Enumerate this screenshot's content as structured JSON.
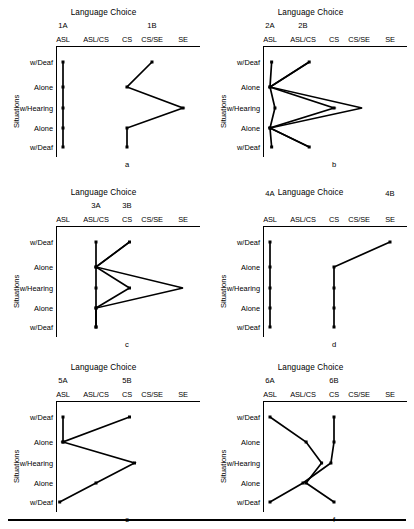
{
  "figure": {
    "y_axis_title": "Situations",
    "x_categories": [
      "ASL",
      "ASL/CS",
      "CS",
      "CS/SE",
      "SE"
    ],
    "y_categories": [
      "w/Deaf",
      "Alone",
      "w/Hearing",
      "Alone",
      "w/Deaf"
    ],
    "chart_title": "Language Choice",
    "bottom_rule": true
  },
  "chart_data": [
    {
      "type": "line",
      "panel": "a",
      "title": "Language Choice",
      "xlabel": "",
      "ylabel": "Situations",
      "categories": [
        "ASL",
        "ASL/CS",
        "CS",
        "CS/SE",
        "SE"
      ],
      "y_categories": [
        "w/Deaf",
        "Alone",
        "w/Hearing",
        "Alone",
        "w/Deaf"
      ],
      "xlim": [
        0,
        4
      ],
      "grid": false,
      "legend": "top-labels",
      "series": [
        {
          "name": "1A",
          "label_x": 0.0,
          "values": [
            0.0,
            0.0,
            0.0,
            0.0,
            0.0
          ]
        },
        {
          "name": "1B",
          "label_x": 3.0,
          "values": [
            3.0,
            2.0,
            4.0,
            2.0,
            2.0
          ]
        }
      ]
    },
    {
      "type": "line",
      "panel": "b",
      "title": "Language Choice",
      "xlabel": "",
      "ylabel": "Situations",
      "categories": [
        "ASL",
        "ASL/CS",
        "CS",
        "CS/SE",
        "SE"
      ],
      "y_categories": [
        "w/Deaf",
        "Alone",
        "w/Hearing",
        "Alone",
        "w/Deaf"
      ],
      "xlim": [
        0,
        4
      ],
      "grid": false,
      "legend": "top-labels",
      "series": [
        {
          "name": "2A",
          "label_x": 0.0,
          "values": [
            0.05,
            0.0,
            0.15,
            0.0,
            0.05
          ]
        },
        {
          "name": "2B",
          "label_x": 1.0,
          "values": [
            1.2,
            0.0,
            2.0,
            0.0,
            1.2
          ]
        },
        {
          "name": "2B-outer",
          "label_x": 1.0,
          "values": [
            1.2,
            0.0,
            3.1,
            0.0,
            1.2
          ]
        }
      ]
    },
    {
      "type": "line",
      "panel": "c",
      "title": "Language Choice",
      "xlabel": "",
      "ylabel": "Situations",
      "categories": [
        "ASL",
        "ASL/CS",
        "CS",
        "CS/SE",
        "SE"
      ],
      "y_categories": [
        "w/Deaf",
        "Alone",
        "w/Hearing",
        "Alone",
        "w/Deaf"
      ],
      "xlim": [
        0,
        4
      ],
      "grid": false,
      "legend": "top-labels",
      "series": [
        {
          "name": "3A",
          "label_x": 1.0,
          "values": [
            1.0,
            1.0,
            1.0,
            1.0,
            1.0
          ]
        },
        {
          "name": "3B",
          "label_x": 2.0,
          "values": [
            2.1,
            1.0,
            2.1,
            1.0,
            1.0
          ]
        },
        {
          "name": "3B-outer",
          "label_x": 2.0,
          "values": [
            2.1,
            1.0,
            4.0,
            1.0,
            1.0
          ]
        }
      ]
    },
    {
      "type": "line",
      "panel": "d",
      "title": "Language Choice",
      "xlabel": "",
      "ylabel": "Situations",
      "categories": [
        "ASL",
        "ASL/CS",
        "CS",
        "CS/SE",
        "SE"
      ],
      "y_categories": [
        "w/Deaf",
        "Alone",
        "w/Hearing",
        "Alone",
        "w/Deaf"
      ],
      "xlim": [
        0,
        4
      ],
      "grid": false,
      "legend": "top-labels",
      "series": [
        {
          "name": "4A",
          "label_x": 0.0,
          "values": [
            0.0,
            0.0,
            0.0,
            0.0,
            0.0
          ]
        },
        {
          "name": "4B",
          "label_x": 4.0,
          "values": [
            4.0,
            2.0,
            2.0,
            2.0,
            2.0
          ]
        }
      ]
    },
    {
      "type": "line",
      "panel": "e",
      "title": "Language Choice",
      "xlabel": "",
      "ylabel": "Situations",
      "categories": [
        "ASL",
        "ASL/CS",
        "CS",
        "CS/SE",
        "SE"
      ],
      "y_categories": [
        "w/Deaf",
        "Alone",
        "w/Hearing",
        "Alone",
        "w/Deaf"
      ],
      "xlim": [
        0,
        4
      ],
      "grid": false,
      "legend": "top-labels",
      "series": [
        {
          "name": "5A",
          "label_x": 0.0,
          "values": [
            0.0,
            0.0,
            null,
            null,
            null
          ]
        },
        {
          "name": "5B",
          "label_x": 2.0,
          "values": [
            2.1,
            0.0,
            2.3,
            1.0,
            -0.1
          ]
        }
      ]
    },
    {
      "type": "line",
      "panel": "f",
      "title": "Language Choice",
      "xlabel": "",
      "ylabel": "Situations",
      "categories": [
        "ASL",
        "ASL/CS",
        "CS",
        "CS/SE",
        "SE"
      ],
      "y_categories": [
        "w/Deaf",
        "Alone",
        "w/Hearing",
        "Alone",
        "w/Deaf"
      ],
      "xlim": [
        0,
        4
      ],
      "grid": false,
      "legend": "top-labels",
      "series": [
        {
          "name": "6A",
          "label_x": 0.0,
          "values": [
            0.0,
            1.1,
            1.6,
            1.1,
            2.0
          ]
        },
        {
          "name": "6B",
          "label_x": 2.0,
          "values": [
            2.0,
            2.0,
            1.9,
            1.0,
            0.0
          ]
        }
      ]
    }
  ],
  "panel_letters": [
    "a",
    "b",
    "c",
    "d",
    "e",
    "f"
  ]
}
